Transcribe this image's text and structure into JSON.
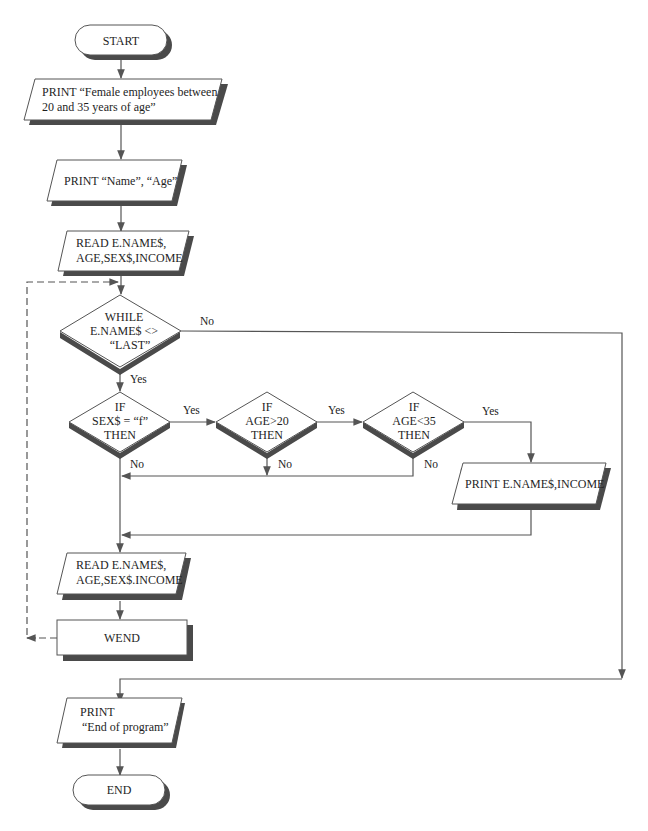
{
  "diagram": {
    "type": "flowchart",
    "colors": {
      "stroke": "#555555",
      "shadow": "#4a4a4a",
      "fill": "#ffffff",
      "text": "#1e1e1e"
    },
    "nodes": {
      "start": {
        "kind": "terminal",
        "lines": [
          "START"
        ]
      },
      "print_title": {
        "kind": "io",
        "lines": [
          "PRINT “Female employees between",
          "20 and 35 years of age”"
        ]
      },
      "print_header": {
        "kind": "io",
        "lines": [
          "PRINT “Name”,  “Age”"
        ]
      },
      "read_1": {
        "kind": "io",
        "lines": [
          "READ E.NAME$,",
          "AGE,SEX$,INCOME"
        ]
      },
      "while": {
        "kind": "decision",
        "lines": [
          "WHILE",
          "E.NAME$ <>",
          "“LAST”"
        ]
      },
      "if_sex": {
        "kind": "decision",
        "lines": [
          "IF",
          "SEX$ = “f”",
          "THEN"
        ]
      },
      "if_age_gt": {
        "kind": "decision",
        "lines": [
          "IF",
          "AGE>20",
          "THEN"
        ]
      },
      "if_age_lt": {
        "kind": "decision",
        "lines": [
          "IF",
          "AGE<35",
          "THEN"
        ]
      },
      "print_row": {
        "kind": "io",
        "lines": [
          "PRINT E.NAME$,INCOME"
        ]
      },
      "read_2": {
        "kind": "io",
        "lines": [
          "READ E.NAME$,",
          "AGE,SEX$.INCOME"
        ]
      },
      "wend": {
        "kind": "process",
        "lines": [
          "WEND"
        ]
      },
      "print_end": {
        "kind": "io",
        "lines": [
          "PRINT",
          "“End of program”"
        ]
      },
      "end": {
        "kind": "terminal",
        "lines": [
          "END"
        ]
      }
    },
    "edge_labels": {
      "while_no": "No",
      "while_yes": "Yes",
      "sex_yes": "Yes",
      "sex_no": "No",
      "age_gt_yes": "Yes",
      "age_gt_no": "No",
      "age_lt_yes": "Yes",
      "age_lt_no": "No"
    },
    "edges": [
      {
        "from": "start",
        "to": "print_title"
      },
      {
        "from": "print_title",
        "to": "print_header"
      },
      {
        "from": "print_header",
        "to": "read_1"
      },
      {
        "from": "read_1",
        "to": "while"
      },
      {
        "from": "while",
        "to": "if_sex",
        "label": "Yes"
      },
      {
        "from": "while",
        "to": "print_end",
        "label": "No"
      },
      {
        "from": "if_sex",
        "to": "if_age_gt",
        "label": "Yes"
      },
      {
        "from": "if_sex",
        "to": "read_2",
        "label": "No"
      },
      {
        "from": "if_age_gt",
        "to": "if_age_lt",
        "label": "Yes"
      },
      {
        "from": "if_age_gt",
        "to": "read_2",
        "label": "No"
      },
      {
        "from": "if_age_lt",
        "to": "print_row",
        "label": "Yes"
      },
      {
        "from": "if_age_lt",
        "to": "read_2",
        "label": "No"
      },
      {
        "from": "print_row",
        "to": "read_2"
      },
      {
        "from": "read_2",
        "to": "wend"
      },
      {
        "from": "wend",
        "to": "while",
        "style": "dashed"
      },
      {
        "from": "print_end",
        "to": "end"
      }
    ]
  }
}
